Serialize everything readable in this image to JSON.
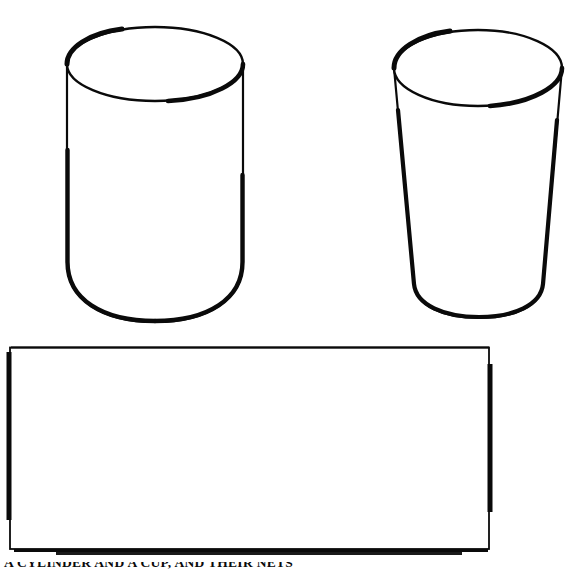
{
  "page": {
    "background_color": "#ffffff",
    "ink_color": "#0a0a0a",
    "width": 579,
    "height": 572,
    "kind": "scanned-line-drawing"
  },
  "figure": {
    "caption_clipped": "A CYLINDER AND A CUP, AND THEIR NETS",
    "shapes": [
      {
        "id": "left-cylinder",
        "name": "cylinder",
        "description": "Right circular cylinder, straight sides, rounded base",
        "top_ellipse": {
          "cx": 155,
          "cy": 64,
          "rx": 88,
          "ry": 37
        },
        "left_x": 67,
        "right_x": 243,
        "top_y": 27,
        "bottom_y": 322,
        "stroke_width": 3
      },
      {
        "id": "right-cup",
        "name": "tapered-cup",
        "description": "Truncated cone, wider at top than at base",
        "top_ellipse": {
          "cx": 478,
          "cy": 68,
          "rx": 84,
          "ry": 38
        },
        "top_left_x": 394,
        "top_right_x": 562,
        "bottom_left_x": 417,
        "bottom_right_x": 542,
        "top_y": 30,
        "bottom_y": 318,
        "stroke_width": 3
      },
      {
        "id": "lateral-rectangle",
        "name": "rectangle",
        "description": "Unrolled lateral surface of the cylinder",
        "left_x": 10,
        "top_y": 347,
        "right_x": 489,
        "bottom_y": 549,
        "stroke_width": 2
      }
    ]
  }
}
